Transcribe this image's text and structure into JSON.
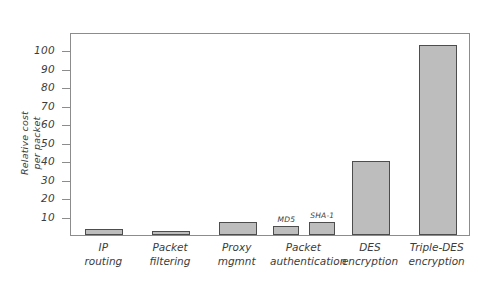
{
  "chart_data": {
    "type": "bar",
    "title": "",
    "xlabel": "",
    "ylabel": "Relative cost per packet",
    "ylabel_line1": "Relative cost",
    "ylabel_line2": "per packet",
    "ylim": [
      0,
      110
    ],
    "yticks": [
      10,
      20,
      30,
      40,
      50,
      60,
      70,
      80,
      90,
      100
    ],
    "grid": false,
    "legend": "none",
    "categories": [
      "IP routing",
      "Packet filtering",
      "Proxy mgmnt",
      "Packet authentication",
      "DES encryption",
      "Triple-DES encryption"
    ],
    "category_lines": [
      [
        "IP",
        "routing"
      ],
      [
        "Packet",
        "filtering"
      ],
      [
        "Proxy",
        "mgmnt"
      ],
      [
        "Packet",
        "authentication"
      ],
      [
        "DES",
        "encryption"
      ],
      [
        "Triple-DES",
        "encryption"
      ]
    ],
    "bars": [
      {
        "category": "IP routing",
        "label": "",
        "value": 3
      },
      {
        "category": "Packet filtering",
        "label": "",
        "value": 2
      },
      {
        "category": "Proxy mgmnt",
        "label": "",
        "value": 7
      },
      {
        "category": "Packet authentication",
        "label": "MD5",
        "value": 5
      },
      {
        "category": "Packet authentication",
        "label": "SHA-1",
        "value": 7
      },
      {
        "category": "DES encryption",
        "label": "",
        "value": 40
      },
      {
        "category": "Triple-DES encryption",
        "label": "",
        "value": 103
      }
    ],
    "colors": {
      "bar_fill": "#bdbdbd",
      "bar_stroke": "#4d4d4d",
      "axis": "#8c8c8c",
      "text": "#3c3c3c",
      "background": "#ffffff"
    }
  }
}
